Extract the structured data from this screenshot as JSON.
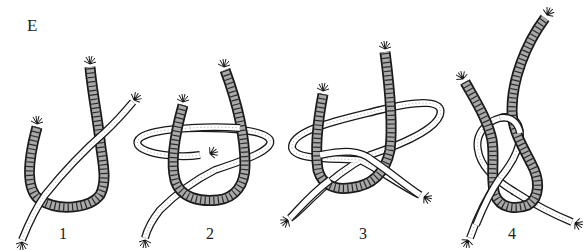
{
  "figure": {
    "panel_label": "E",
    "steps": [
      {
        "label": "1"
      },
      {
        "label": "2"
      },
      {
        "label": "3"
      },
      {
        "label": "4"
      }
    ]
  },
  "colors": {
    "background": "#ffffff",
    "outline": "#1a1a1a",
    "dark_rope_fill": "#a9a9a9",
    "light_rope_fill": "#ffffff"
  }
}
